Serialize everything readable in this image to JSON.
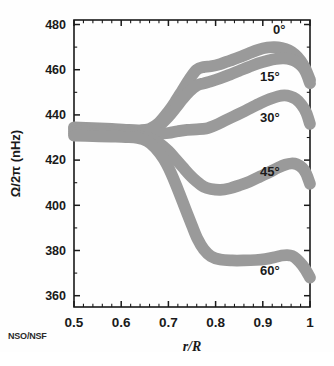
{
  "figure": {
    "credit": "NSO/NSF",
    "background_color": "#ffffff",
    "curve_color": "#9a9a9a",
    "axis_color": "#1a1a1a",
    "text_color": "#1a1a1a"
  },
  "chart_data": {
    "type": "line",
    "title": "",
    "subtitle": "",
    "xlabel": "r/R",
    "ylabel": "Ω/2π (nHz)",
    "xlim": [
      0.5,
      1.0
    ],
    "ylim": [
      355,
      482
    ],
    "grid": false,
    "legend_position": "inline-right",
    "x_ticks": [
      0.5,
      0.6,
      0.7,
      0.8,
      0.9,
      1.0
    ],
    "x_tick_labels": [
      "0.5",
      "0.6",
      "0.7",
      "0.8",
      "0.9",
      "1"
    ],
    "x_minor_tick_count": 5,
    "y_ticks": [
      360,
      380,
      400,
      420,
      440,
      460,
      480
    ],
    "y_tick_labels": [
      "360",
      "380",
      "400",
      "420",
      "440",
      "460",
      "480"
    ],
    "y_minor_tick_count": 2,
    "band_half_width_nHz": 2.6,
    "annotations": [
      {
        "text": "0°",
        "x": 0.935,
        "y": 476
      },
      {
        "text": "15°",
        "x": 0.915,
        "y": 455
      },
      {
        "text": "30°",
        "x": 0.915,
        "y": 437
      },
      {
        "text": "45°",
        "x": 0.915,
        "y": 413
      },
      {
        "text": "60°",
        "x": 0.915,
        "y": 369
      }
    ],
    "series": [
      {
        "name": "0°",
        "label": "0°",
        "color": "#9a9a9a",
        "x": [
          0.5,
          0.54,
          0.58,
          0.61,
          0.64,
          0.66,
          0.68,
          0.7,
          0.715,
          0.73,
          0.745,
          0.76,
          0.775,
          0.79,
          0.81,
          0.83,
          0.85,
          0.87,
          0.89,
          0.91,
          0.925,
          0.94,
          0.955,
          0.968,
          0.98,
          0.99,
          1.0
        ],
        "y": [
          434.5,
          434.2,
          433.8,
          433.4,
          433.2,
          433.8,
          436.5,
          441.5,
          446.0,
          451.0,
          456.0,
          460.0,
          461.2,
          461.5,
          462.5,
          464.0,
          465.5,
          467.2,
          468.8,
          469.8,
          470.0,
          469.6,
          468.6,
          466.8,
          464.0,
          460.5,
          455.5
        ]
      },
      {
        "name": "15°",
        "label": "15°",
        "color": "#9a9a9a",
        "x": [
          0.5,
          0.54,
          0.58,
          0.61,
          0.64,
          0.66,
          0.68,
          0.7,
          0.715,
          0.73,
          0.745,
          0.76,
          0.775,
          0.79,
          0.81,
          0.83,
          0.85,
          0.87,
          0.89,
          0.91,
          0.928,
          0.945,
          0.96,
          0.972,
          0.984,
          0.992,
          1.0
        ],
        "y": [
          433.8,
          433.5,
          433.0,
          432.6,
          432.4,
          433.0,
          435.2,
          439.2,
          443.0,
          447.0,
          450.5,
          453.0,
          454.0,
          454.8,
          456.2,
          457.8,
          459.5,
          461.2,
          462.8,
          464.0,
          464.8,
          465.0,
          464.5,
          463.4,
          461.2,
          458.5,
          454.0
        ]
      },
      {
        "name": "30°",
        "label": "30°",
        "color": "#9a9a9a",
        "x": [
          0.5,
          0.54,
          0.58,
          0.61,
          0.64,
          0.66,
          0.68,
          0.7,
          0.72,
          0.74,
          0.76,
          0.78,
          0.8,
          0.82,
          0.845,
          0.87,
          0.895,
          0.915,
          0.932,
          0.946,
          0.958,
          0.97,
          0.982,
          0.992,
          1.0
        ],
        "y": [
          432.6,
          432.4,
          432.2,
          432.0,
          431.8,
          431.6,
          431.6,
          432.0,
          432.8,
          433.4,
          433.6,
          434.0,
          435.5,
          437.5,
          440.0,
          442.6,
          445.2,
          447.0,
          448.2,
          448.6,
          448.2,
          447.0,
          444.5,
          441.0,
          436.0
        ]
      },
      {
        "name": "45°",
        "label": "45°",
        "color": "#9a9a9a",
        "x": [
          0.5,
          0.54,
          0.58,
          0.61,
          0.64,
          0.66,
          0.68,
          0.7,
          0.715,
          0.73,
          0.745,
          0.76,
          0.775,
          0.79,
          0.81,
          0.83,
          0.85,
          0.872,
          0.895,
          0.915,
          0.932,
          0.948,
          0.96,
          0.972,
          0.984,
          0.992,
          1.0
        ],
        "y": [
          431.8,
          431.5,
          431.2,
          430.8,
          430.4,
          429.6,
          427.5,
          424.0,
          420.5,
          417.0,
          413.5,
          410.5,
          408.2,
          407.2,
          406.8,
          407.5,
          408.8,
          410.5,
          412.8,
          414.8,
          416.6,
          418.0,
          418.5,
          418.2,
          416.5,
          414.0,
          409.5
        ]
      },
      {
        "name": "60°",
        "label": "60°",
        "color": "#9a9a9a",
        "x": [
          0.5,
          0.54,
          0.58,
          0.61,
          0.635,
          0.655,
          0.672,
          0.69,
          0.705,
          0.72,
          0.735,
          0.75,
          0.762,
          0.775,
          0.79,
          0.81,
          0.835,
          0.86,
          0.885,
          0.905,
          0.925,
          0.94,
          0.952,
          0.962,
          0.972,
          0.984,
          0.992,
          1.0
        ],
        "y": [
          430.8,
          430.6,
          430.4,
          430.2,
          429.8,
          428.4,
          425.5,
          420.5,
          414.5,
          407.0,
          399.0,
          391.0,
          385.0,
          380.5,
          377.5,
          376.0,
          375.6,
          375.6,
          375.8,
          376.2,
          377.0,
          377.8,
          378.0,
          377.6,
          376.2,
          373.5,
          371.0,
          368.0
        ]
      }
    ]
  }
}
